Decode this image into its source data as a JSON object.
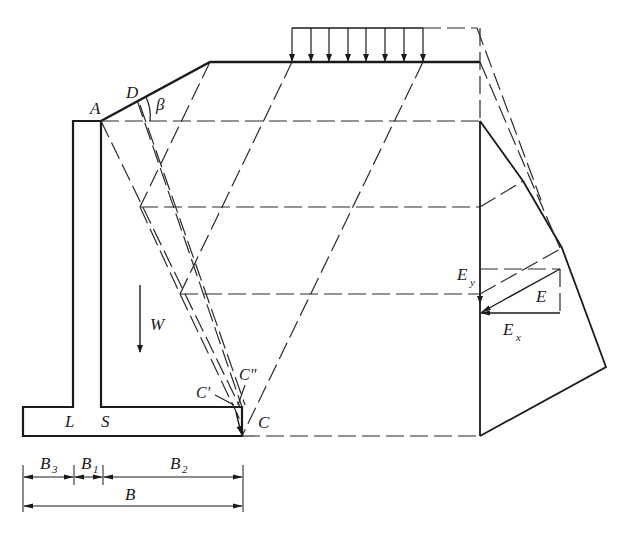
{
  "diagram": {
    "type": "cantilever retaining wall earth pressure graphical construction",
    "colors": {
      "line": "#1a1a1a",
      "background": "#ffffff"
    },
    "points": {
      "A": "A",
      "D": "D",
      "C": "C",
      "C_prime": "C'",
      "C_double_prime": "C\"",
      "L": "L",
      "S": "S"
    },
    "angle_label": "β",
    "weight_label": "W",
    "forces": {
      "E": "E",
      "Ey_main": "E",
      "Ey_sub": "y",
      "Ex_main": "E",
      "Ex_sub": "x"
    },
    "dimensions": {
      "B3_main": "B",
      "B3_sub": "3",
      "B1_main": "B",
      "B1_sub": "1",
      "B2_main": "B",
      "B2_sub": "2",
      "B_total": "B"
    },
    "surcharge_arrow_count": 8
  }
}
